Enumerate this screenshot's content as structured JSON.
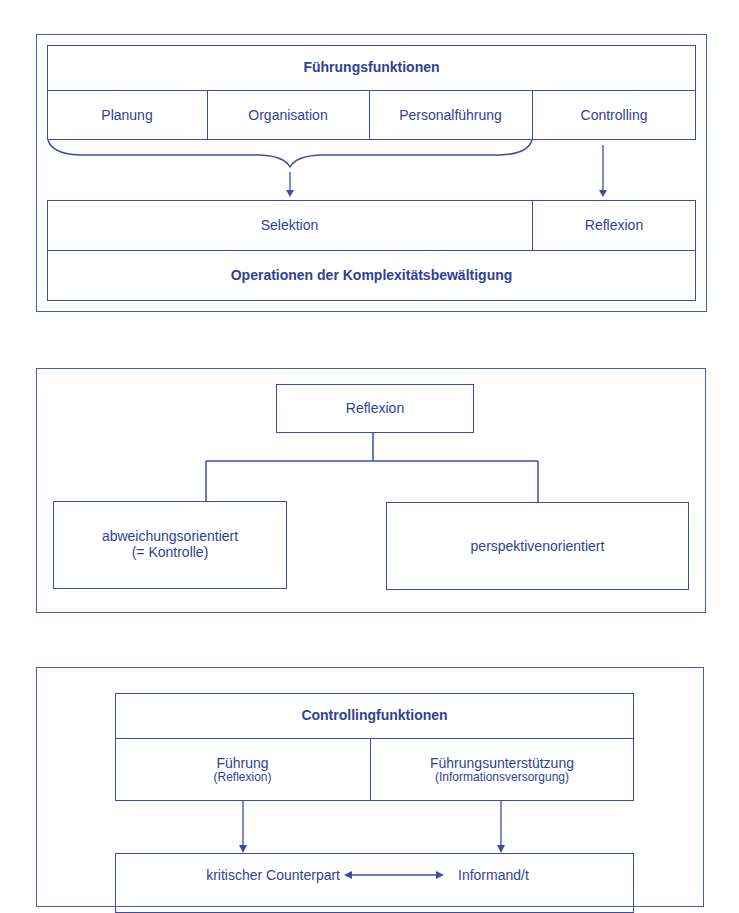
{
  "diagram1": {
    "title": "Führungsfunktionen",
    "functions": [
      "Planung",
      "Organisation",
      "Personalführung",
      "Controlling"
    ],
    "operations": [
      "Selektion",
      "Reflexion"
    ],
    "footer": "Operationen der Komplexitätsbewältigung"
  },
  "diagram2": {
    "root": "Reflexion",
    "children": [
      {
        "line1": "abweichungsorientiert",
        "line2": "(= Kontrolle)"
      },
      {
        "line1": "perspektivenorientiert"
      }
    ]
  },
  "diagram3": {
    "title": "Controllingfunktionen",
    "functions": [
      {
        "label": "Führung",
        "sub": "(Reflexion)"
      },
      {
        "label": "Führungsunterstützung",
        "sub": "(Informationsversorgung)"
      }
    ],
    "roles": [
      "kritischer Counterpart",
      "Informand/t"
    ]
  },
  "colors": {
    "line": "#3a4ca8",
    "text": "#2f3f9a",
    "background": "#ffffff"
  }
}
